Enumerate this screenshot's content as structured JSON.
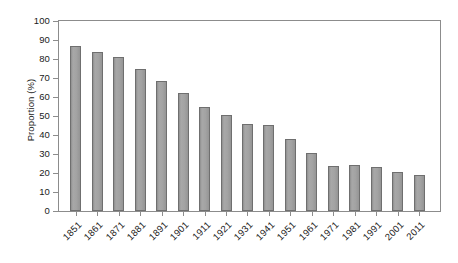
{
  "chart_data": {
    "type": "bar",
    "title": "",
    "subtitle": "",
    "xlabel": "",
    "ylabel": "Proportion (%)",
    "ylim": [
      0,
      100
    ],
    "ytick_step": 10,
    "yticks": [
      100,
      90,
      80,
      70,
      60,
      50,
      40,
      30,
      20,
      10,
      0
    ],
    "grid": false,
    "legend": null,
    "legend_position": "none",
    "bar_color": "#9d9d9d",
    "bar_border_color": "#6f6f6f",
    "frame_color": "#8c8c8c",
    "text_color": "#1a1a1a",
    "categories": [
      "1851",
      "1861",
      "1871",
      "1881",
      "1891",
      "1901",
      "1911",
      "1921",
      "1931",
      "1941",
      "1951",
      "1961",
      "1971",
      "1981",
      "1991",
      "2001",
      "2011"
    ],
    "values": [
      87,
      83.5,
      81,
      74.5,
      68.5,
      62,
      54.5,
      50.3,
      46,
      45.5,
      38,
      30.5,
      23.7,
      24,
      23,
      20.5,
      18.7
    ],
    "x_label_rotation_deg": -45
  }
}
